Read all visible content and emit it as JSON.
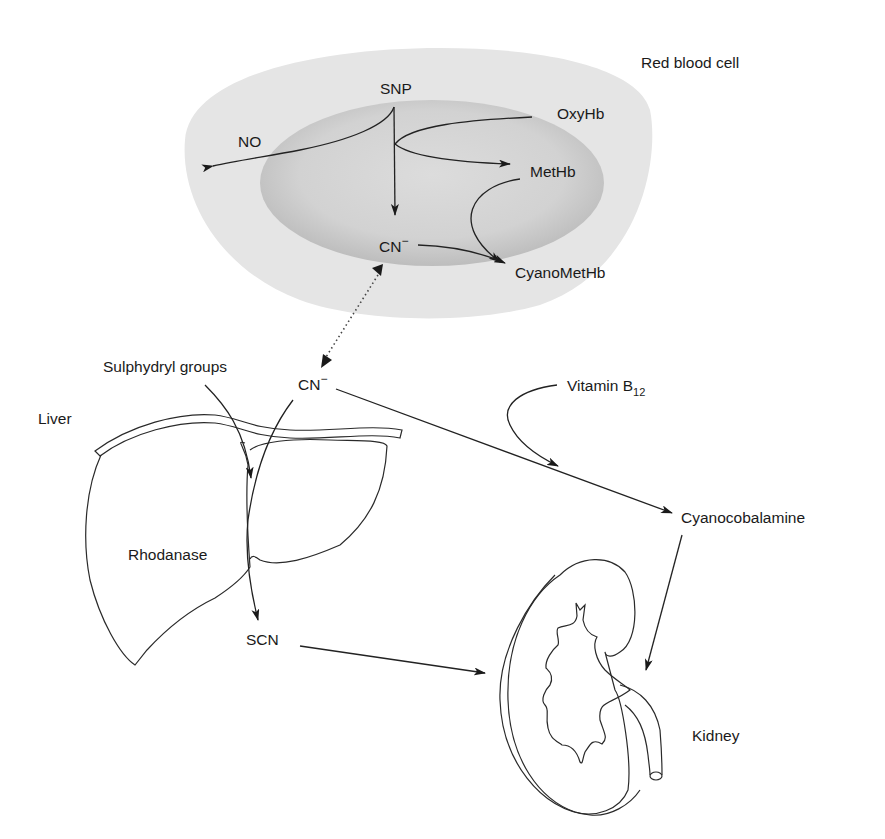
{
  "figure": {
    "type": "pathway-diagram"
  },
  "colors": {
    "background": "#ffffff",
    "rbc_outer": "#e4e4e4",
    "rbc_inner": "#cdcdcd",
    "line": "#222222",
    "text": "#1a1a1a"
  },
  "red_blood_cell": {
    "label": "Red blood cell",
    "nodes": {
      "snp": "SNP",
      "no": "NO",
      "oxyhb": "OxyHb",
      "methb": "MetHb",
      "cn": "CN",
      "cn_charge": "−",
      "cyanomethb": "CyanoMetHb"
    }
  },
  "liver": {
    "label": "Liver",
    "enzyme": "Rhodanase",
    "cofactor": "Sulphydryl groups",
    "product": "SCN"
  },
  "plasma": {
    "cn": "CN",
    "cn_charge": "−"
  },
  "vitamin": {
    "label": "Vitamin B",
    "subscript": "12",
    "product": "Cyanocobalamine"
  },
  "kidney": {
    "label": "Kidney"
  },
  "edges": [
    {
      "from": "SNP",
      "to": "NO"
    },
    {
      "from": "SNP",
      "to": "CN−"
    },
    {
      "from": "OxyHb",
      "to": "MetHb",
      "via": "SNP"
    },
    {
      "from": "MetHb",
      "to": "CyanoMetHb"
    },
    {
      "from": "CN−",
      "to": "CyanoMetHb"
    },
    {
      "from": "CN− (RBC)",
      "to": "CN− (plasma)",
      "style": "dotted",
      "bidirectional": true
    },
    {
      "from": "CN− (plasma)",
      "to": "SCN",
      "via": "Rhodanase"
    },
    {
      "from": "Sulphydryl groups",
      "to": "Liver"
    },
    {
      "from": "CN− (plasma)",
      "to": "Cyanocobalamine"
    },
    {
      "from": "Vitamin B12",
      "to": "Cyanocobalamine"
    },
    {
      "from": "SCN",
      "to": "Kidney"
    },
    {
      "from": "Cyanocobalamine",
      "to": "Kidney"
    }
  ]
}
